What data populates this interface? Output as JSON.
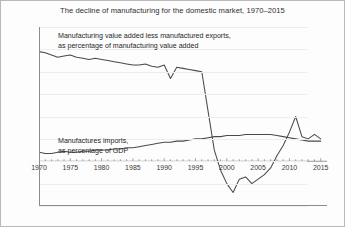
{
  "chart_data": {
    "type": "line",
    "title": "The decline of manufacturing for the domestic market, 1970–2015",
    "xlabel": "",
    "ylabel": "",
    "xlim": [
      1970,
      2016
    ],
    "ylim": [
      -40,
      120
    ],
    "ytick_values": [
      -40,
      -20,
      0,
      20,
      40,
      60,
      80,
      100,
      120
    ],
    "ytick_labels": [
      "-40%",
      "-20%",
      "0%",
      "20%",
      "40%",
      "60%",
      "80%",
      "100%",
      "120%"
    ],
    "xtick_values": [
      1970,
      1975,
      1980,
      1985,
      1990,
      1995,
      2000,
      2005,
      2010,
      2015
    ],
    "xtick_labels": [
      "1970",
      "1975",
      "1980",
      "1985",
      "1990",
      "1995",
      "2000",
      "2005",
      "2010",
      "2015"
    ],
    "grid": "horizontal",
    "legend": "annotations-inline",
    "line_color": "#4a4a4a",
    "grid_color": "#ededed",
    "axis_color": "#8c8c8c",
    "annotations": [
      {
        "name": "upper-series-label",
        "line1": "Manufacturing value added less manufactured exports,",
        "line2": "as percentage of manufacturing value added"
      },
      {
        "name": "lower-series-label",
        "line1": "Manufactures imports,",
        "line2": "as percentage of GDP"
      }
    ],
    "x": [
      1970,
      1971,
      1972,
      1973,
      1974,
      1975,
      1976,
      1977,
      1978,
      1979,
      1980,
      1981,
      1982,
      1983,
      1984,
      1985,
      1986,
      1987,
      1988,
      1989,
      1990,
      1991,
      1992,
      1993,
      1994,
      1995,
      1996,
      1997,
      1998,
      1999,
      2000,
      2001,
      2002,
      2003,
      2004,
      2005,
      2006,
      2007,
      2008,
      2009,
      2010,
      2011,
      2012,
      2013,
      2014,
      2015
    ],
    "series": [
      {
        "name": "Manufacturing value added less manufactured exports, as percentage of manufacturing value added",
        "values": [
          98,
          97,
          95,
          93,
          94,
          95,
          93,
          92,
          91,
          92,
          91,
          90,
          89,
          88,
          87,
          86,
          86,
          87,
          85,
          84,
          86,
          74,
          84,
          83,
          82,
          81,
          80,
          45,
          10,
          -8,
          -20,
          -28,
          -16,
          -14,
          -20,
          -16,
          -12,
          -6,
          5,
          14,
          26,
          40,
          22,
          20,
          24,
          20
        ]
      },
      {
        "name": "Manufactures imports, as percentage of GDP",
        "values": [
          8,
          7,
          7,
          8,
          9,
          8,
          8,
          9,
          9,
          10,
          10,
          10,
          11,
          11,
          12,
          12,
          13,
          14,
          15,
          16,
          17,
          17,
          18,
          18,
          19,
          20,
          20,
          21,
          22,
          22,
          23,
          23,
          23,
          24,
          24,
          24,
          24,
          24,
          23,
          22,
          21,
          20,
          19,
          18,
          18,
          18
        ]
      }
    ]
  }
}
